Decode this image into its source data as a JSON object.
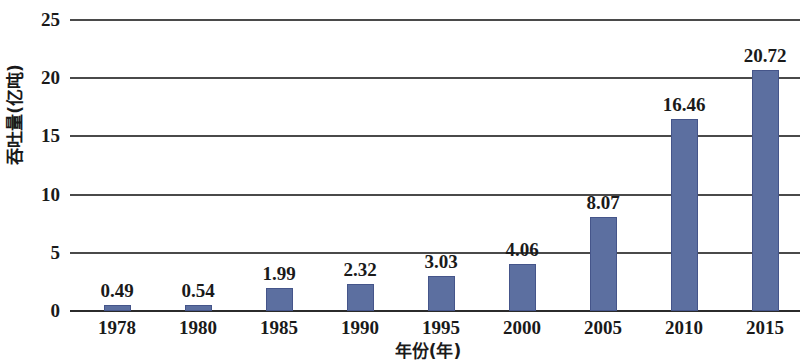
{
  "chart_data": {
    "type": "bar",
    "title": "",
    "xlabel": "年份(年)",
    "ylabel": "吞吐量(亿吨)",
    "categories": [
      "1978",
      "1980",
      "1985",
      "1990",
      "1995",
      "2000",
      "2005",
      "2010",
      "2015"
    ],
    "values": [
      0.49,
      0.54,
      1.99,
      2.32,
      3.03,
      4.06,
      8.07,
      16.46,
      20.72
    ],
    "value_labels": [
      "0.49",
      "0.54",
      "1.99",
      "2.32",
      "3.03",
      "4.06",
      "8.07",
      "16.46",
      "20.72"
    ],
    "ylim": [
      0,
      25
    ],
    "ytick_values": [
      0,
      5,
      10,
      15,
      20,
      25
    ],
    "ytick_labels": [
      "0",
      "5",
      "10",
      "15",
      "20",
      "25"
    ],
    "grid": true,
    "grid_axis": "y",
    "legend": false,
    "legend_position": "none",
    "bar_color": "#5c6fa0",
    "bar_border_color": "#45558a",
    "gridline_color": "#4a4a4a",
    "axis_color": "#2b2b2b",
    "background_color": "#ffffff",
    "text_color": "#1a1a1a"
  }
}
